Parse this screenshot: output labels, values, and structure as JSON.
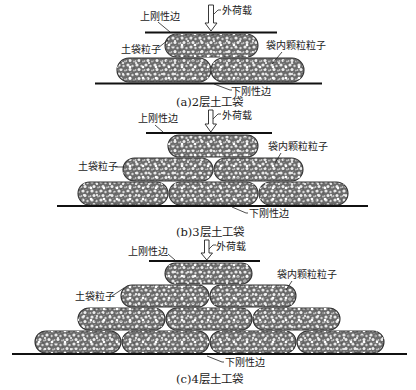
{
  "figure": {
    "panels": [
      {
        "id": "a",
        "caption": "(a)2层土工袋",
        "layers": 2,
        "rows": [
          1,
          2
        ],
        "labels": {
          "top_plate": "上刚性边",
          "load": "外荷载",
          "bag_particle": "土袋粒子",
          "inner_particle": "袋内颗粒粒子",
          "bottom_plate": "下刚性边"
        }
      },
      {
        "id": "b",
        "caption": "(b)3层土工袋",
        "layers": 3,
        "rows": [
          1,
          2,
          3
        ],
        "labels": {
          "top_plate": "上刚性边",
          "load": "外荷载",
          "bag_particle": "土袋粒子",
          "inner_particle": "袋内颗粒粒子",
          "bottom_plate": "下刚性边"
        }
      },
      {
        "id": "c",
        "caption": "(c)4层土工袋",
        "layers": 4,
        "rows": [
          1,
          2,
          3,
          4
        ],
        "labels": {
          "top_plate": "上刚性边",
          "load": "外荷载",
          "bag_particle": "土袋粒子",
          "inner_particle": "袋内颗粒粒子",
          "bottom_plate": "下刚性边"
        }
      }
    ],
    "colors": {
      "bag_fill": "#6e6e6e",
      "particle": "#e8e8e8",
      "plate": "#111111",
      "text": "#1a1a1a"
    }
  }
}
